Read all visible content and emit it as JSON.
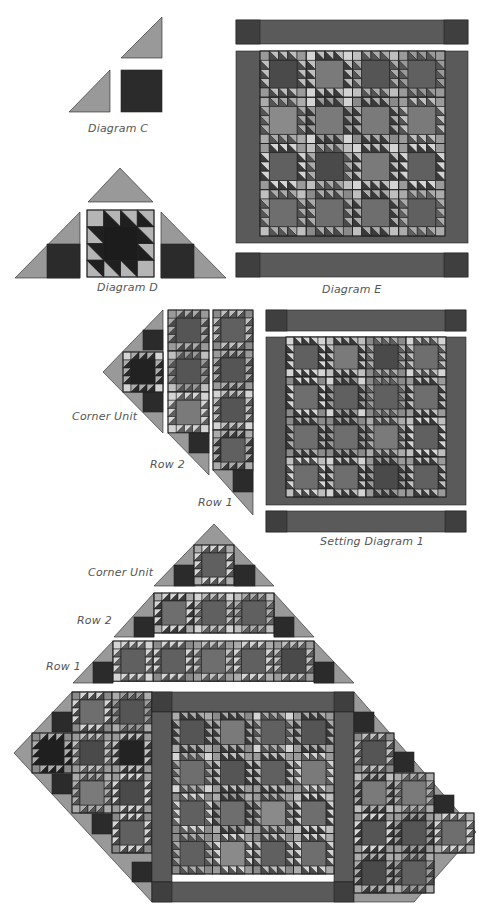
{
  "labels": {
    "diagram_c": "Diagram C",
    "diagram_d": "Diagram D",
    "diagram_e": "Diagram E",
    "corner_unit_1": "Corner Unit",
    "row_2_a": "Row 2",
    "row_1_a": "Row 1",
    "setting_diagram": "Setting Diagram 1",
    "corner_unit_2": "Corner Unit",
    "row_2_b": "Row 2",
    "row_1_b": "Row 1"
  },
  "colors": {
    "setting_triangle": "#999999",
    "dark_square": "#2b2b2b",
    "border": "#5a5a5a",
    "border_corner": "#3f3f3f",
    "block_center": "#454545",
    "light": "#bdbdbd",
    "lighter": "#d9d9d9",
    "outline": "#222222"
  }
}
